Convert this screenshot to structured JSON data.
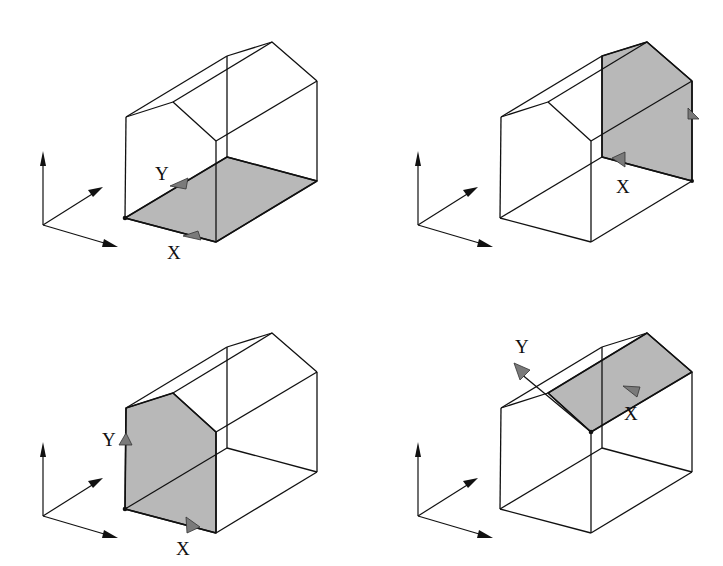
{
  "figure": {
    "type": "coordinate-frame illustration",
    "panels": [
      {
        "id": "panel-floor",
        "offset": [
          0,
          0
        ],
        "highlighted_face": "floor",
        "labels": {
          "x": "X",
          "y": "Y"
        }
      },
      {
        "id": "panel-back-wall",
        "offset": [
          375,
          0
        ],
        "highlighted_face": "back gable wall",
        "labels": {
          "x": "X"
        }
      },
      {
        "id": "panel-front-wall",
        "offset": [
          0,
          291
        ],
        "highlighted_face": "front gable wall",
        "labels": {
          "x": "X",
          "y": "Y"
        }
      },
      {
        "id": "panel-roof",
        "offset": [
          375,
          291
        ],
        "highlighted_face": "right roof slope",
        "labels": {
          "x": "X",
          "y": "Y"
        }
      }
    ],
    "colors": {
      "line": "#111111",
      "face_fill": "#b8b8b8",
      "marker_fill": "#7a7a7a",
      "background": "#ffffff"
    }
  }
}
